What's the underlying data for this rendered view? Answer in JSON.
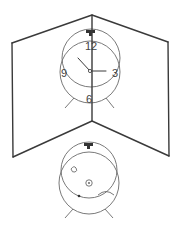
{
  "figure": {
    "mirror_clock": {
      "numerals": {
        "twelve": "12",
        "three": "3",
        "six": "6",
        "nine": "9"
      },
      "hands": {
        "hour_points_to": "about 10:30",
        "minute_points_to": "3"
      }
    },
    "back_clock": {
      "features": [
        "winding key",
        "knob",
        "small dot",
        "curved lever"
      ]
    },
    "colors": {
      "line": "#3a3a3a",
      "background": "#ffffff"
    }
  }
}
